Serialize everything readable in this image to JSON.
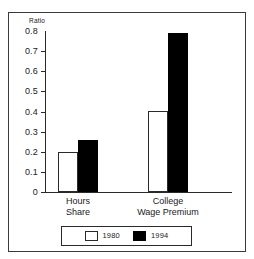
{
  "chart_data": {
    "type": "bar",
    "title": "",
    "xlabel": "",
    "ylabel": "Ratio",
    "ylim": [
      0,
      0.8
    ],
    "grid": false,
    "legend_position": "bottom",
    "categories": [
      "Hours\nShare",
      "College\nWage Premium"
    ],
    "category_lines": [
      [
        "Hours",
        "Share"
      ],
      [
        "College",
        "Wage Premium"
      ]
    ],
    "ytick_labels": [
      "0.8",
      "0.7",
      "0.6",
      "0.5",
      "0.4",
      "0.3",
      "0.2",
      "0.1",
      "0"
    ],
    "ytick_values": [
      0.8,
      0.7,
      0.6,
      0.5,
      0.4,
      0.3,
      0.2,
      0.1,
      0
    ],
    "series": [
      {
        "name": "1980",
        "color": "#ffffff",
        "values": [
          0.2,
          0.4
        ]
      },
      {
        "name": "1994",
        "color": "#000000",
        "values": [
          0.26,
          0.79
        ]
      }
    ]
  },
  "legend": {
    "entries": [
      {
        "label": "1980",
        "style": "light"
      },
      {
        "label": "1994",
        "style": "dark"
      }
    ]
  },
  "colors": {
    "frame": "#3a3a3a",
    "axis": "#2a2a2a",
    "bar_1980": "#ffffff",
    "bar_1994": "#000000",
    "background": "#ffffff",
    "text": "#1a1a1a"
  }
}
